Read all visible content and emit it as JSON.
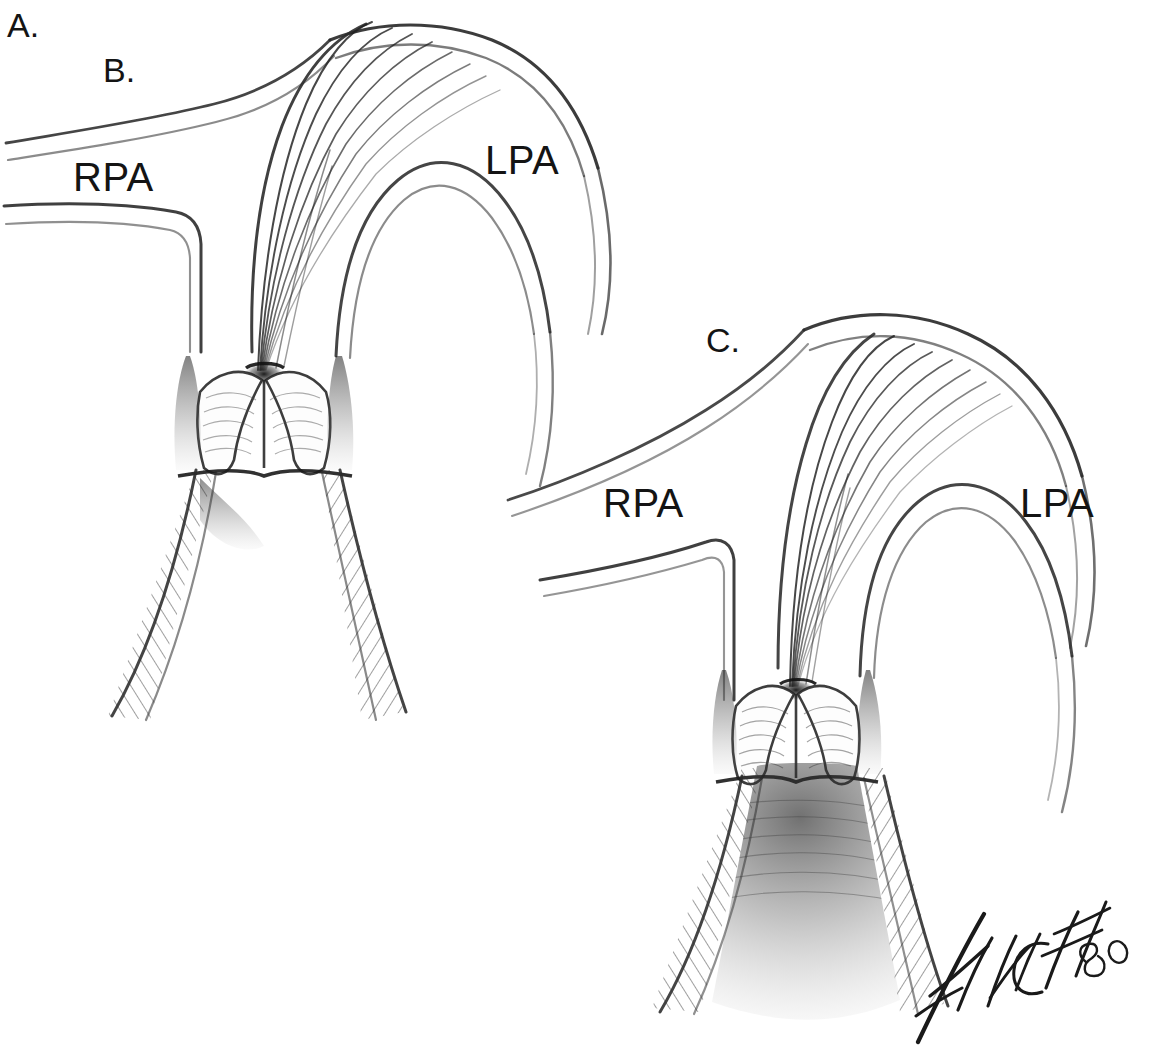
{
  "figure": {
    "domain": "Diagram",
    "medium": "pencil-drawing",
    "background_color": "#ffffff",
    "ink_color": "#141414",
    "width": 1149,
    "height": 1058
  },
  "labels": {
    "figure_letter": "A.",
    "panel_b_letter": "B.",
    "panel_c_letter": "C.",
    "panel_b_rpa": "RPA",
    "panel_b_lpa": "LPA",
    "panel_c_rpa": "RPA",
    "panel_c_lpa": "LPA"
  },
  "signature": {
    "artist": "FINCH",
    "year": "80",
    "full": "FINCH 80"
  },
  "panels": [
    {
      "id": "B",
      "letter": "B.",
      "description": "Domed stenotic pulmonary valve with fused commissures; thin-walled right ventricular outflow tract shown with light hatching.",
      "structures": [
        "main pulmonary artery",
        "right pulmonary artery",
        "left pulmonary artery",
        "domed fused valve leaflets",
        "narrow central orifice",
        "sinuses of Valsalva",
        "right ventricular outflow tract"
      ]
    },
    {
      "id": "C",
      "letter": "C.",
      "description": "Stenotic pulmonary valve with marked infundibular muscular hypertrophy; outflow tract heavily shaded and narrowed.",
      "structures": [
        "main pulmonary artery",
        "right pulmonary artery",
        "left pulmonary artery",
        "domed fused valve leaflets",
        "narrow central orifice",
        "sinuses of Valsalva",
        "hypertrophied infundibulum"
      ]
    }
  ]
}
